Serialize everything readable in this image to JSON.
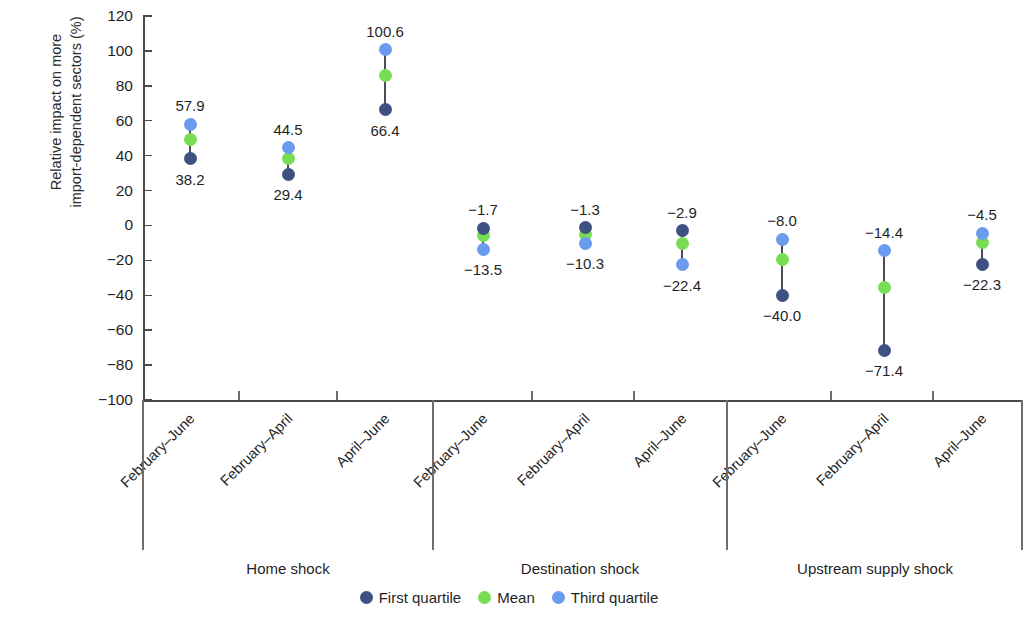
{
  "chart_data": {
    "type": "scatter",
    "title": "",
    "xlabel": "",
    "ylabel": "Relative impact on more\nimport-dependent sectors (%)",
    "ylim": [
      -100,
      120
    ],
    "ytick_labels": [
      "120",
      "100",
      "80",
      "60",
      "40",
      "20",
      "0",
      "−20",
      "−40",
      "−60",
      "−80",
      "−100"
    ],
    "ytick_values": [
      120,
      100,
      80,
      60,
      40,
      20,
      0,
      -20,
      -40,
      -60,
      -80,
      -100
    ],
    "grid": false,
    "legend_position": "bottom-center",
    "groups": [
      {
        "name": "Home shock",
        "categories": [
          "February–June",
          "February–April",
          "April–June"
        ],
        "points": [
          {
            "category": "February–June",
            "first_quartile": 38.2,
            "mean": 49.0,
            "third_quartile": 57.9,
            "top_label": "57.9",
            "bottom_label": "38.2"
          },
          {
            "category": "February–April",
            "first_quartile": 29.4,
            "mean": 38.5,
            "third_quartile": 44.5,
            "top_label": "44.5",
            "bottom_label": "29.4"
          },
          {
            "category": "April–June",
            "first_quartile": 66.4,
            "mean": 86.0,
            "third_quartile": 100.6,
            "top_label": "100.6",
            "bottom_label": "66.4"
          }
        ]
      },
      {
        "name": "Destination shock",
        "categories": [
          "February–June",
          "February–April",
          "April–June"
        ],
        "points": [
          {
            "category": "February–June",
            "first_quartile": -1.7,
            "mean": -6.0,
            "third_quartile": -13.5,
            "top_label": "−1.7",
            "bottom_label": "−13.5"
          },
          {
            "category": "February–April",
            "first_quartile": -1.3,
            "mean": -5.0,
            "third_quartile": -10.3,
            "top_label": "−1.3",
            "bottom_label": "−10.3"
          },
          {
            "category": "April–June",
            "first_quartile": -2.9,
            "mean": -10.5,
            "third_quartile": -22.4,
            "top_label": "−2.9",
            "bottom_label": "−22.4"
          }
        ]
      },
      {
        "name": "Upstream supply shock",
        "categories": [
          "February–June",
          "February–April",
          "April–June"
        ],
        "points": [
          {
            "category": "February–June",
            "first_quartile": -40.0,
            "mean": -19.5,
            "third_quartile": -8.0,
            "top_label": "−8.0",
            "bottom_label": "−40.0"
          },
          {
            "category": "February–April",
            "first_quartile": -71.4,
            "mean": -35.5,
            "third_quartile": -14.4,
            "top_label": "−14.4",
            "bottom_label": "−71.4"
          },
          {
            "category": "April–June",
            "first_quartile": -22.3,
            "mean": -10.0,
            "third_quartile": -4.5,
            "top_label": "−4.5",
            "bottom_label": "−22.3"
          }
        ]
      }
    ],
    "series_colors": {
      "first_quartile": "#3f5183",
      "mean": "#76dd54",
      "third_quartile": "#6a9bef"
    },
    "legend": [
      {
        "label": "First quartile",
        "color": "#3f5183"
      },
      {
        "label": "Mean",
        "color": "#76dd54"
      },
      {
        "label": "Third quartile",
        "color": "#6a9bef"
      }
    ]
  }
}
